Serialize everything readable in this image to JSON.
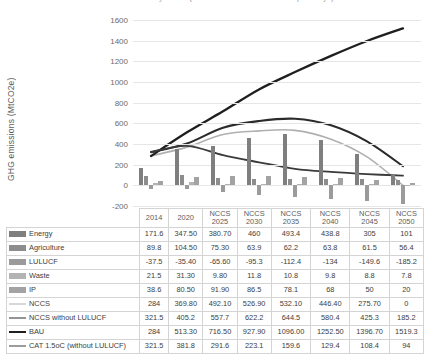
{
  "chart_title": "GHG emissions by sector (NCCS vs BAU vs CAT 1.5oC pathways)",
  "axis": {
    "ylabel": "GHG emissions (MtCO2e)",
    "yticks": [
      1600,
      1400,
      1200,
      1000,
      800,
      600,
      400,
      200,
      0,
      -200
    ],
    "ymin": -200,
    "ymax": 1600
  },
  "table": {
    "corner_label": "",
    "headers": [
      {
        "line1": "2014",
        "line2": ""
      },
      {
        "line1": "2020",
        "line2": ""
      },
      {
        "line1": "NCCS",
        "line2": "2025"
      },
      {
        "line1": "NCCS",
        "line2": "2030"
      },
      {
        "line1": "NCCS",
        "line2": "2035"
      },
      {
        "line1": "NCCS",
        "line2": "2040"
      },
      {
        "line1": "NCCS",
        "line2": "2045"
      },
      {
        "line1": "NCCS",
        "line2": "2050"
      }
    ]
  },
  "chart_data": {
    "type": "bar",
    "title": "GHG emissions by sector (NCCS vs BAU vs CAT 1.5oC pathways)",
    "xlabel": "",
    "ylabel": "GHG emissions (MtCO2e)",
    "ylim": [
      -200,
      1600
    ],
    "ytick_step": 200,
    "grid": true,
    "legend_position": "table-left",
    "categories": [
      "2014",
      "2020",
      "NCCS 2025",
      "NCCS 2030",
      "NCCS 2035",
      "NCCS 2040",
      "NCCS 2045",
      "NCCS 2050"
    ],
    "bar_series": [
      {
        "name": "Energy",
        "color": "#7f7f7f",
        "values": [
          171.6,
          347.5,
          380.7,
          460,
          493.4,
          438.8,
          305,
          101
        ],
        "display": [
          "171.6",
          "347.50",
          "380.70",
          "460",
          "493.4",
          "438.8",
          "305",
          "101"
        ]
      },
      {
        "name": "Agriculture",
        "color": "#8d8d8d",
        "values": [
          89.8,
          104.5,
          75.3,
          63.9,
          62.2,
          63.8,
          61.5,
          56.4
        ],
        "display": [
          "89.8",
          "104.50",
          "75.30",
          "63.9",
          "62.2",
          "63.8",
          "61.5",
          "56.4"
        ]
      },
      {
        "name": "LULUCF",
        "color": "#9b9b9b",
        "values": [
          -37.5,
          -35.4,
          -65.6,
          -95.3,
          -112.4,
          -134,
          -149.6,
          -185.2
        ],
        "display": [
          "-37.5",
          "-35.40",
          "-65.60",
          "-95.3",
          "-112.4",
          "-134",
          "-149.6",
          "-185.2"
        ]
      },
      {
        "name": "Waste",
        "color": "#b3b3b3",
        "values": [
          21.5,
          31.3,
          9.8,
          11.8,
          10.8,
          9.8,
          8.8,
          7.8
        ],
        "display": [
          "21.5",
          "31.30",
          "9.80",
          "11.8",
          "10.8",
          "9.8",
          "8.8",
          "7.8"
        ]
      },
      {
        "name": "IP",
        "color": "#a3a3a3",
        "values": [
          38.6,
          80.5,
          91.9,
          86.5,
          78.1,
          68,
          50,
          20
        ],
        "display": [
          "38.6",
          "80.50",
          "91.90",
          "86.5",
          "78.1",
          "68",
          "50",
          "20"
        ]
      }
    ],
    "line_series": [
      {
        "name": "NCCS",
        "color": "#b0b0b0",
        "width": 1.6,
        "values": [
          284,
          369.8,
          492.1,
          526.9,
          532.1,
          446.4,
          275.7,
          0
        ],
        "display": [
          "284",
          "369.80",
          "492.10",
          "526.90",
          "532.10",
          "446.40",
          "275.70",
          "0"
        ]
      },
      {
        "name": "NCCS without LULUCF",
        "color": "#2b2b2b",
        "width": 2.1,
        "values": [
          321.5,
          405.2,
          557.7,
          622.2,
          644.5,
          580.4,
          425.3,
          185.2
        ],
        "display": [
          "321.5",
          "405.2",
          "557.7",
          "622.2",
          "644.5",
          "580.4",
          "425.3",
          "185.2"
        ]
      },
      {
        "name": "BAU",
        "color": "#1f1f1f",
        "width": 2.3,
        "values": [
          284,
          513.3,
          716.5,
          927.9,
          1096.0,
          1252.5,
          1396.7,
          1519.3
        ],
        "display": [
          "284",
          "513.30",
          "716.50",
          "927.90",
          "1096.00",
          "1252.50",
          "1396.70",
          "1519.3"
        ]
      },
      {
        "name": "CAT 1.5oC (without LULUCF)",
        "color": "#3a3a3a",
        "width": 1.8,
        "values": [
          321.5,
          381.8,
          291.6,
          223.1,
          159.6,
          129.4,
          108.4,
          94
        ],
        "display": [
          "321.5",
          "381.8",
          "291.6",
          "223.1",
          "159.6",
          "129.4",
          "108.4",
          "94"
        ]
      }
    ]
  }
}
